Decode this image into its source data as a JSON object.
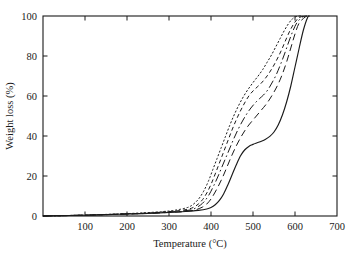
{
  "figure": {
    "background": "#ffffff",
    "axis_color": "#1a1a1a",
    "line_color": "#1a1a1a"
  },
  "chart_data": {
    "type": "line",
    "title": "",
    "subtitle": "",
    "xlabel": "Temperature (°C)",
    "ylabel": "Weight loss (%)",
    "xlim": [
      0,
      700
    ],
    "ylim": [
      100,
      0
    ],
    "y_inverted": true,
    "grid": false,
    "legend_position": "none",
    "xticks": [
      0,
      100,
      200,
      300,
      400,
      500,
      600,
      700
    ],
    "xticklabels": [
      "",
      "100",
      "200",
      "300",
      "400",
      "500",
      "600",
      "700"
    ],
    "yticks": [
      0,
      20,
      40,
      60,
      80,
      100
    ],
    "yticklabels": [
      "0",
      "20",
      "40",
      "60",
      "80",
      "100"
    ],
    "xtick_minor_step": 0,
    "annotations": [],
    "series": [
      {
        "name": "curve-1",
        "style": "solid",
        "dash": "none",
        "x": [
          0,
          25,
          50,
          75,
          100,
          150,
          200,
          250,
          300,
          330,
          350,
          370,
          390,
          400,
          410,
          420,
          430,
          440,
          450,
          460,
          470,
          480,
          490,
          500,
          510,
          520,
          530,
          540,
          550,
          560,
          570,
          580,
          590,
          600,
          610,
          620,
          630,
          635
        ],
        "y": [
          0.0,
          0.1,
          0.2,
          0.3,
          0.4,
          0.7,
          1.0,
          1.3,
          1.8,
          2.1,
          2.4,
          2.8,
          3.5,
          4.2,
          5.6,
          7.8,
          11.0,
          15.5,
          20.5,
          25.5,
          30.0,
          33.0,
          34.8,
          35.8,
          36.6,
          37.4,
          38.4,
          39.8,
          42.0,
          45.5,
          50.5,
          57.0,
          65.0,
          74.5,
          84.0,
          93.0,
          99.3,
          100.0
        ]
      },
      {
        "name": "curve-2",
        "style": "dashed-long",
        "dash": "7,4",
        "x": [
          0,
          25,
          50,
          75,
          100,
          150,
          200,
          250,
          300,
          330,
          350,
          365,
          380,
          390,
          400,
          410,
          420,
          430,
          440,
          450,
          460,
          470,
          480,
          490,
          500,
          510,
          520,
          530,
          540,
          550,
          560,
          570,
          580,
          590,
          600,
          610,
          625,
          632
        ],
        "y": [
          0.0,
          0.1,
          0.2,
          0.3,
          0.4,
          0.7,
          1.0,
          1.3,
          1.8,
          2.2,
          2.6,
          3.2,
          4.5,
          6.0,
          8.5,
          12.0,
          16.0,
          20.5,
          25.5,
          30.5,
          35.0,
          39.0,
          42.5,
          45.5,
          48.0,
          50.5,
          53.0,
          55.5,
          58.5,
          62.0,
          66.0,
          71.0,
          77.0,
          84.0,
          91.0,
          96.5,
          99.6,
          100.0
        ]
      },
      {
        "name": "curve-3",
        "style": "dash-dot",
        "dash": "8,3,1.6,3",
        "x": [
          0,
          25,
          50,
          75,
          100,
          150,
          200,
          250,
          300,
          330,
          350,
          362,
          375,
          385,
          395,
          405,
          415,
          425,
          435,
          445,
          455,
          465,
          475,
          485,
          495,
          505,
          515,
          525,
          535,
          545,
          555,
          565,
          575,
          585,
          595,
          605,
          618,
          628
        ],
        "y": [
          0.0,
          0.1,
          0.2,
          0.3,
          0.4,
          0.7,
          1.0,
          1.4,
          2.0,
          2.5,
          3.0,
          3.8,
          5.5,
          7.5,
          10.5,
          14.5,
          19.0,
          24.0,
          29.0,
          34.0,
          39.0,
          43.5,
          47.5,
          51.0,
          54.0,
          56.5,
          58.6,
          60.5,
          63.0,
          66.5,
          70.5,
          75.5,
          81.0,
          87.0,
          92.5,
          96.8,
          99.5,
          100.0
        ]
      },
      {
        "name": "curve-4",
        "style": "dashed-short",
        "dash": "4,3",
        "x": [
          0,
          25,
          50,
          75,
          100,
          150,
          200,
          250,
          300,
          325,
          345,
          358,
          370,
          380,
          390,
          400,
          410,
          420,
          430,
          440,
          450,
          460,
          470,
          480,
          490,
          500,
          510,
          520,
          530,
          540,
          550,
          560,
          570,
          580,
          590,
          600,
          610,
          622
        ],
        "y": [
          0.0,
          0.1,
          0.2,
          0.3,
          0.4,
          0.7,
          1.1,
          1.5,
          2.2,
          2.7,
          3.4,
          4.3,
          6.0,
          8.2,
          11.5,
          15.8,
          21.0,
          26.5,
          32.0,
          37.5,
          43.0,
          48.0,
          52.5,
          56.5,
          60.0,
          62.5,
          64.5,
          66.5,
          69.0,
          72.0,
          75.5,
          79.5,
          84.0,
          89.0,
          93.5,
          97.0,
          99.2,
          100.0
        ]
      },
      {
        "name": "curve-5",
        "style": "dotted",
        "dash": "1.3,2.6",
        "x": [
          0,
          25,
          50,
          75,
          100,
          150,
          200,
          250,
          300,
          320,
          340,
          352,
          364,
          374,
          384,
          394,
          404,
          414,
          424,
          434,
          444,
          454,
          464,
          474,
          484,
          494,
          504,
          514,
          524,
          534,
          544,
          554,
          564,
          574,
          584,
          594,
          604,
          614
        ],
        "y": [
          0.0,
          0.1,
          0.2,
          0.3,
          0.5,
          0.8,
          1.2,
          1.7,
          2.5,
          3.1,
          4.0,
          5.0,
          7.0,
          9.5,
          13.0,
          17.5,
          23.0,
          28.5,
          34.0,
          39.5,
          45.0,
          50.0,
          54.5,
          58.5,
          62.0,
          65.0,
          67.8,
          70.5,
          73.5,
          77.0,
          80.5,
          84.5,
          88.5,
          92.5,
          96.0,
          98.6,
          99.8,
          100.0
        ]
      }
    ]
  }
}
